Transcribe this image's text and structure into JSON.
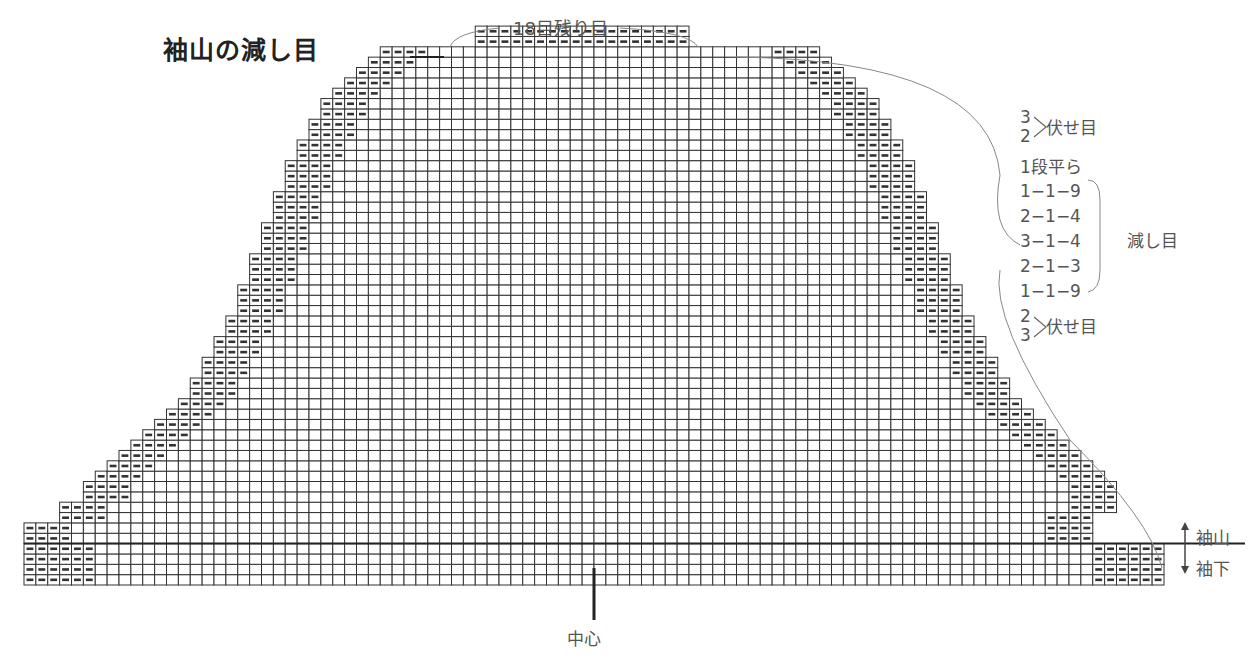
{
  "title": "袖山の減し目",
  "top_label": "18目残り目",
  "center_label": "中心",
  "side_labels": {
    "upper": "袖山",
    "lower": "袖下"
  },
  "schedule": {
    "top_bind_off": {
      "numbers": [
        "3",
        "2"
      ],
      "label": "伏せ目"
    },
    "flat_rows": "1段平ら",
    "decreases": [
      "1−1−9",
      "2−1−4",
      "3−1−4",
      "2−1−3",
      "1−1−9"
    ],
    "decrease_label": "減し目",
    "bottom_bind_off": {
      "numbers": [
        "2",
        "3"
      ],
      "label": "伏せ目"
    }
  },
  "grid": {
    "total_columns": 96,
    "remaining_stitches": 18,
    "sleeve_underarm_rows": 4,
    "line_color": "#333333",
    "purl_mark_color": "#333333"
  }
}
